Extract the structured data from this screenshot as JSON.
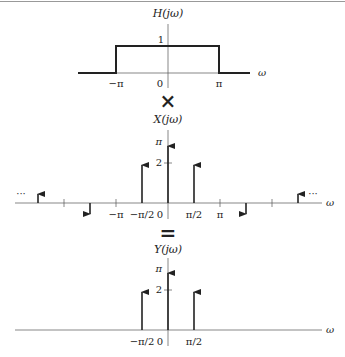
{
  "diagram": {
    "colors": {
      "line": "#222222",
      "axis": "#555555",
      "top_rule": "#999999"
    },
    "operators": {
      "multiply": "×",
      "equals": "="
    },
    "h_plot": {
      "title": "H(jω)",
      "x_axis_label": "ω",
      "y_tick_label": "1",
      "x_tick_labels": [
        "−π",
        "0",
        "π"
      ],
      "description": "Ideal lowpass filter, magnitude 1 for |ω| < π"
    },
    "x_plot": {
      "title": "X(jω)",
      "x_axis_label": "ω",
      "y_tick_labels": [
        "π",
        "2"
      ],
      "x_tick_labels": [
        "−π",
        "−π/2",
        "0",
        "π/2",
        "π"
      ],
      "ellipsis_left": "···",
      "ellipsis_right": "···",
      "impulses": [
        {
          "omega": "-5π/2",
          "direction": "up",
          "size": "small"
        },
        {
          "omega": "-3π/2",
          "direction": "down",
          "size": "small"
        },
        {
          "omega": "-π/2",
          "direction": "up",
          "size": "2"
        },
        {
          "omega": "0",
          "direction": "up",
          "size": "π"
        },
        {
          "omega": "π/2",
          "direction": "up",
          "size": "2"
        },
        {
          "omega": "3π/2",
          "direction": "down",
          "size": "small"
        },
        {
          "omega": "5π/2",
          "direction": "up",
          "size": "small"
        }
      ]
    },
    "y_plot": {
      "title": "Y(jω)",
      "x_axis_label": "ω",
      "y_tick_labels": [
        "π",
        "2"
      ],
      "x_tick_labels": [
        "−π/2",
        "0",
        "π/2"
      ],
      "impulses": [
        {
          "omega": "-π/2",
          "direction": "up",
          "size": "2"
        },
        {
          "omega": "0",
          "direction": "up",
          "size": "π"
        },
        {
          "omega": "π/2",
          "direction": "up",
          "size": "2"
        }
      ]
    }
  }
}
